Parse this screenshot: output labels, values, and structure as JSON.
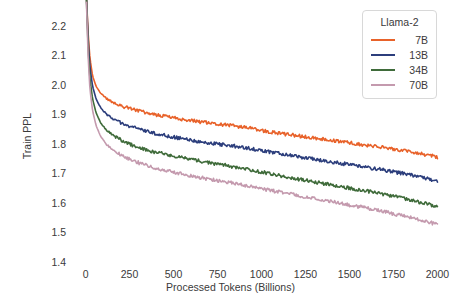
{
  "chart_data": {
    "type": "line",
    "title": "",
    "xlabel": "Processed Tokens (Billions)",
    "ylabel": "Train PPL",
    "xlim": [
      -60,
      2060
    ],
    "ylim": [
      1.4,
      2.24
    ],
    "xticks": [
      0,
      250,
      500,
      750,
      1000,
      1250,
      1500,
      1750,
      2000
    ],
    "xticklabels": [
      "0",
      "250",
      "500",
      "750",
      "1000",
      "1250",
      "1500",
      "1750",
      "2000"
    ],
    "yticks": [
      1.4,
      1.5,
      1.6,
      1.7,
      1.8,
      1.9,
      2.0,
      2.1,
      2.2
    ],
    "yticklabels": [
      "1.4",
      "1.5",
      "1.6",
      "1.7",
      "1.8",
      "1.9",
      "2.0",
      "2.1",
      "2.2"
    ],
    "grid": false,
    "legend_position": "upper right",
    "legend_title": "Llama-2",
    "noise_amplitude": 0.006,
    "x": [
      5,
      15,
      25,
      40,
      60,
      85,
      120,
      160,
      210,
      270,
      340,
      420,
      500,
      600,
      700,
      800,
      900,
      1000,
      1100,
      1200,
      1300,
      1400,
      1500,
      1600,
      1700,
      1800,
      1900,
      2000
    ],
    "series": [
      {
        "name": "7B",
        "color": "#E8622A",
        "values": [
          2.3,
          2.17,
          2.09,
          2.03,
          1.995,
          1.972,
          1.953,
          1.94,
          1.928,
          1.917,
          1.906,
          1.896,
          1.888,
          1.879,
          1.871,
          1.864,
          1.857,
          1.845,
          1.836,
          1.828,
          1.82,
          1.812,
          1.804,
          1.796,
          1.787,
          1.778,
          1.768,
          1.756
        ]
      },
      {
        "name": "13B",
        "color": "#2C3E7C",
        "values": [
          2.3,
          2.15,
          2.06,
          1.995,
          1.952,
          1.923,
          1.9,
          1.884,
          1.87,
          1.856,
          1.843,
          1.832,
          1.823,
          1.813,
          1.804,
          1.796,
          1.788,
          1.778,
          1.768,
          1.758,
          1.748,
          1.739,
          1.73,
          1.721,
          1.711,
          1.7,
          1.688,
          1.674
        ]
      },
      {
        "name": "34B",
        "color": "#3F6B3A",
        "values": [
          2.29,
          2.12,
          2.02,
          1.952,
          1.905,
          1.872,
          1.846,
          1.828,
          1.811,
          1.795,
          1.781,
          1.769,
          1.759,
          1.747,
          1.737,
          1.727,
          1.717,
          1.705,
          1.693,
          1.682,
          1.671,
          1.661,
          1.651,
          1.64,
          1.629,
          1.617,
          1.603,
          1.588
        ]
      },
      {
        "name": "70B",
        "color": "#C49AAE",
        "values": [
          2.28,
          2.09,
          1.985,
          1.912,
          1.862,
          1.826,
          1.798,
          1.778,
          1.76,
          1.743,
          1.728,
          1.715,
          1.704,
          1.692,
          1.681,
          1.671,
          1.661,
          1.649,
          1.637,
          1.626,
          1.615,
          1.604,
          1.593,
          1.582,
          1.57,
          1.557,
          1.543,
          1.527
        ]
      }
    ]
  },
  "legend": {
    "title": "Llama-2",
    "entries": [
      {
        "label": "7B"
      },
      {
        "label": "13B"
      },
      {
        "label": "34B"
      },
      {
        "label": "70B"
      }
    ]
  },
  "axes": {
    "xlabel": "Processed Tokens (Billions)",
    "ylabel": "Train PPL"
  }
}
